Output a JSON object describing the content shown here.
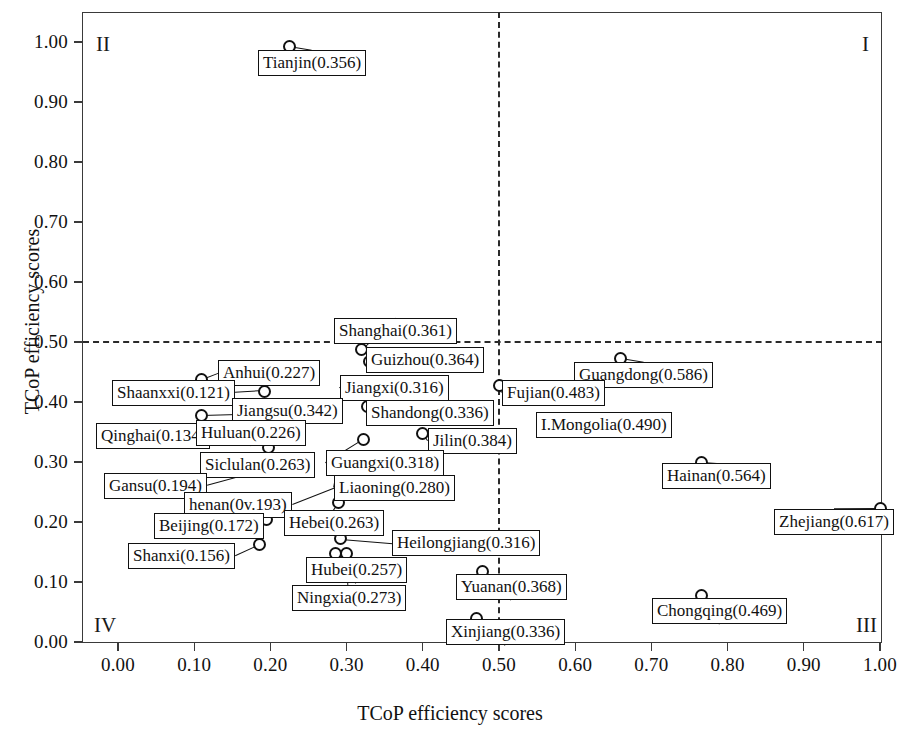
{
  "chart_data": {
    "type": "scatter",
    "title": "",
    "xlabel": "TCoP efficiency scores",
    "ylabel": "TCoP efficiency scores",
    "xlim": [
      -0.035,
      1.055
    ],
    "ylim": [
      -0.05,
      1.05
    ],
    "xticks": [
      "0.00",
      "0.10",
      "0.20",
      "0.30",
      "0.40",
      "0.50",
      "0.60",
      "0.70",
      "0.80",
      "0.90",
      "1.00"
    ],
    "yticks": [
      "0.00",
      "0.10",
      "0.20",
      "0.30",
      "0.40",
      "0.50",
      "0.60",
      "0.70",
      "0.80",
      "0.90",
      "1.00"
    ],
    "grid": false,
    "legend": "none",
    "reference_lines": {
      "vertical_x": 0.5,
      "horizontal_y": 0.5,
      "style": "dashed"
    },
    "quadrants": [
      {
        "name": "I",
        "label": "I",
        "position": "top-right"
      },
      {
        "name": "II",
        "label": "II",
        "position": "top-left"
      },
      {
        "name": "III",
        "label": "III",
        "position": "bottom-right"
      },
      {
        "name": "IV",
        "label": "IV",
        "position": "bottom-left"
      }
    ],
    "points": [
      {
        "label": "Tianjin(0.356)",
        "name": "Tianjin",
        "x": 0.225,
        "y": 0.993,
        "lbl_x": 258,
        "lbl_y": 50,
        "leader": "down"
      },
      {
        "label": "Shanghai(0.361)",
        "name": "Shanghai",
        "x": 0.32,
        "y": 0.488,
        "lbl_x": 334,
        "lbl_y": 318,
        "leader": "down"
      },
      {
        "label": "Guizhou(0.364)",
        "name": "Guizhou",
        "x": 0.33,
        "y": 0.468,
        "lbl_x": 366,
        "lbl_y": 347,
        "leader": "left"
      },
      {
        "label": "Guangdong(0.586)",
        "name": "Guangdong",
        "x": 0.66,
        "y": 0.473,
        "lbl_x": 574,
        "lbl_y": 362,
        "leader": "down"
      },
      {
        "label": "Fujian(0.483)",
        "name": "Fujian",
        "x": 0.5,
        "y": 0.428,
        "lbl_x": 502,
        "lbl_y": 380,
        "leader": "left"
      },
      {
        "label": "I.Mongolia(0.490)",
        "name": "I.Mongolia",
        "x": 0.565,
        "y": 0.366,
        "lbl_x": 536,
        "lbl_y": 412,
        "leader": "left"
      },
      {
        "label": "Anhui(0.227)",
        "name": "Anhui",
        "x": 0.11,
        "y": 0.438,
        "lbl_x": 218,
        "lbl_y": 360,
        "leader": "left"
      },
      {
        "label": "Shaanxxi(0.121)",
        "name": "Shaanxxi",
        "x": 0.192,
        "y": 0.418,
        "lbl_x": 112,
        "lbl_y": 380,
        "leader": "right"
      },
      {
        "label": "Jiangxi(0.316)",
        "name": "Jiangxi",
        "x": 0.305,
        "y": 0.42,
        "lbl_x": 340,
        "lbl_y": 375,
        "leader": "left"
      },
      {
        "label": "Jiangsu(0.342)",
        "name": "Jiangsu",
        "x": 0.11,
        "y": 0.378,
        "lbl_x": 232,
        "lbl_y": 398,
        "leader": "right"
      },
      {
        "label": "Shandong(0.336)",
        "name": "Shandong",
        "x": 0.328,
        "y": 0.392,
        "lbl_x": 366,
        "lbl_y": 400,
        "leader": "left"
      },
      {
        "label": "Qinghai(0.134)",
        "name": "Qinghai",
        "x": 0.192,
        "y": 0.355,
        "lbl_x": 96,
        "lbl_y": 423,
        "leader": "right"
      },
      {
        "label": "Huluan(0.226)",
        "name": "Huluan",
        "x": 0.198,
        "y": 0.355,
        "lbl_x": 196,
        "lbl_y": 420,
        "leader": "up"
      },
      {
        "label": "Jilin(0.384)",
        "name": "Jilin",
        "x": 0.4,
        "y": 0.348,
        "lbl_x": 428,
        "lbl_y": 428,
        "leader": "left"
      },
      {
        "label": "Guangxi(0.318)",
        "name": "Guangxi",
        "x": 0.322,
        "y": 0.337,
        "lbl_x": 326,
        "lbl_y": 450,
        "leader": "left"
      },
      {
        "label": "Siclulan(0.263)",
        "name": "Siclulan",
        "x": 0.198,
        "y": 0.325,
        "lbl_x": 200,
        "lbl_y": 452,
        "leader": "up"
      },
      {
        "label": "Liaoning(0.280)",
        "name": "Liaoning",
        "x": 0.29,
        "y": 0.3,
        "lbl_x": 334,
        "lbl_y": 475,
        "leader": "left"
      },
      {
        "label": "Gansu(0.194)",
        "name": "Gansu",
        "x": 0.198,
        "y": 0.288,
        "lbl_x": 104,
        "lbl_y": 473,
        "leader": "right"
      },
      {
        "label": "henan(0v.193)",
        "name": "henan",
        "x": 0.292,
        "y": 0.26,
        "lbl_x": 184,
        "lbl_y": 492,
        "leader": "right"
      },
      {
        "label": "Hebei(0.263)",
        "name": "Hebei",
        "x": 0.29,
        "y": 0.232,
        "lbl_x": 284,
        "lbl_y": 510,
        "leader": "down"
      },
      {
        "label": "Beijing(0.172)",
        "name": "Beijing",
        "x": 0.195,
        "y": 0.205,
        "lbl_x": 154,
        "lbl_y": 513,
        "leader": "right"
      },
      {
        "label": "Zhejiang(0.617)",
        "name": "Zhejiang",
        "x": 1.0,
        "y": 0.222,
        "lbl_x": 774,
        "lbl_y": 509,
        "leader": "down"
      },
      {
        "label": "Heilongjiang(0.316)",
        "name": "Heilongjiang",
        "x": 0.292,
        "y": 0.172,
        "lbl_x": 392,
        "lbl_y": 530,
        "leader": "left"
      },
      {
        "label": "Shanxi(0.156)",
        "name": "Shanxi",
        "x": 0.186,
        "y": 0.162,
        "lbl_x": 128,
        "lbl_y": 543,
        "leader": "right"
      },
      {
        "label": "Hubei(0.257)",
        "name": "Hubei",
        "x": 0.285,
        "y": 0.147,
        "lbl_x": 306,
        "lbl_y": 557,
        "leader": "up"
      },
      {
        "label": "Ningxia(0.273)",
        "name": "Ningxia",
        "x": 0.3,
        "y": 0.147,
        "lbl_x": 292,
        "lbl_y": 585,
        "leader": "up"
      },
      {
        "label": "Hainan(0.564)",
        "name": "Hainan",
        "x": 0.766,
        "y": 0.3,
        "lbl_x": 662,
        "lbl_y": 463,
        "leader": "down"
      },
      {
        "label": "Yuanan(0.368)",
        "name": "Yuanan",
        "x": 0.478,
        "y": 0.118,
        "lbl_x": 456,
        "lbl_y": 574,
        "leader": "up"
      },
      {
        "label": "Chongqing(0.469)",
        "name": "Chongqing",
        "x": 0.766,
        "y": 0.078,
        "lbl_x": 652,
        "lbl_y": 598,
        "leader": "up"
      },
      {
        "label": "Xinjiang(0.336)",
        "name": "Xinjiang",
        "x": 0.47,
        "y": 0.04,
        "lbl_x": 446,
        "lbl_y": 619,
        "leader": "up"
      }
    ]
  }
}
